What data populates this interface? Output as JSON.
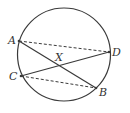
{
  "diagram": {
    "type": "circle-chords",
    "colors": {
      "stroke": "#3a3a3a",
      "text": "#333333",
      "background": "#ffffff"
    },
    "circle": {
      "cx": 64,
      "cy": 54.5,
      "r": 46.5
    },
    "points": {
      "A": {
        "label": "A",
        "x": 19,
        "y": 41
      },
      "B": {
        "label": "B",
        "x": 96,
        "y": 88
      },
      "C": {
        "label": "C",
        "x": 21,
        "y": 76
      },
      "D": {
        "label": "D",
        "x": 109,
        "y": 52
      },
      "X": {
        "label": "X",
        "x": 61,
        "y": 64
      }
    },
    "solid_chords": [
      [
        "A",
        "B"
      ],
      [
        "C",
        "D"
      ]
    ],
    "dashed_segments": [
      [
        "A",
        "D"
      ],
      [
        "C",
        "B"
      ]
    ],
    "intersection": "X"
  }
}
